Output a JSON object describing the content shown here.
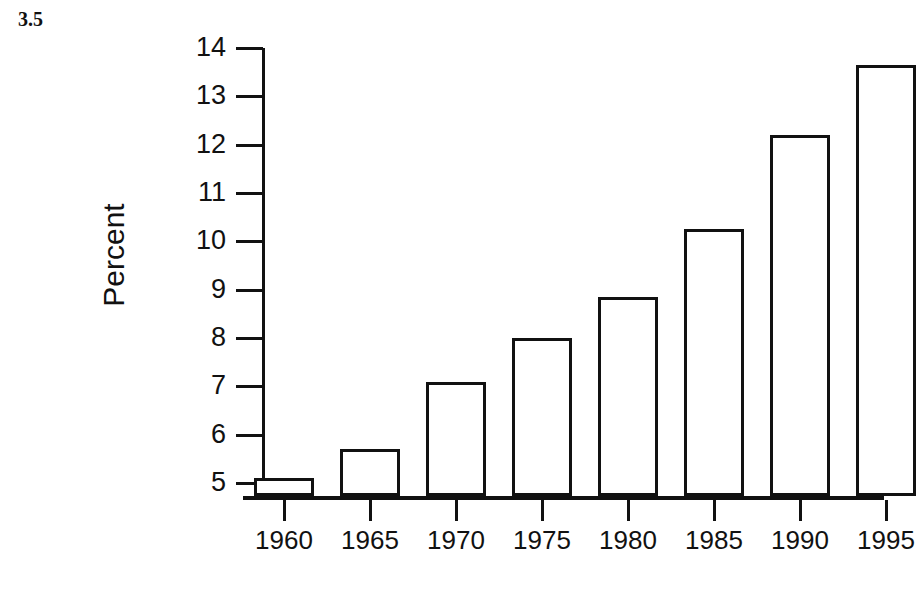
{
  "figure": {
    "number": "3.5"
  },
  "chart_data": {
    "type": "bar",
    "title": "",
    "xlabel": "",
    "ylabel": "Percent",
    "categories": [
      "1960",
      "1965",
      "1970",
      "1975",
      "1980",
      "1985",
      "1990",
      "1995"
    ],
    "values": [
      5.1,
      5.7,
      7.1,
      8.0,
      8.85,
      10.25,
      12.2,
      13.65
    ],
    "ylim": [
      4.71,
      14
    ],
    "y_ticks": [
      5,
      6,
      7,
      8,
      9,
      10,
      11,
      12,
      13,
      14
    ],
    "y_tick_labels": [
      "5",
      "6",
      "7",
      "8",
      "9",
      "10",
      "11",
      "12",
      "13",
      "14"
    ],
    "x_tick_labels": [
      "1960",
      "1965",
      "1970",
      "1975",
      "1980",
      "1985",
      "1990",
      "1995"
    ],
    "grid": false,
    "legend": null,
    "bar_fill_color": "#ffffff",
    "bar_edge_color": "#111111",
    "axis_color": "#111111"
  }
}
